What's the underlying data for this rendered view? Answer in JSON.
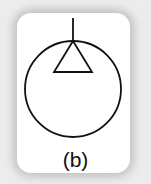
{
  "figure": {
    "label": "(b)",
    "symbol": "circle-with-triangle-and-stem",
    "colors": {
      "background": "#ececec",
      "card": "#ffffff",
      "stroke": "#111111"
    }
  }
}
